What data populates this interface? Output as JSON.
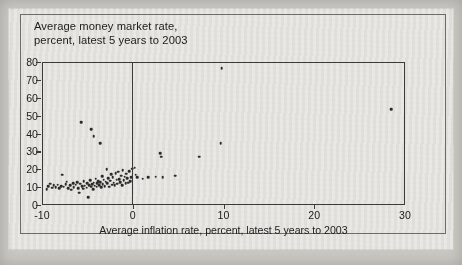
{
  "chart_data": {
    "type": "scatter",
    "title": "Average money market rate, percent, latest 5 years to 2003",
    "title_line1": "Average money market rate,",
    "title_line2": "percent, latest 5 years to 2003",
    "xlabel": "Average inflation rate, percent, latest 5 years to 2003",
    "ylabel": "Average money market rate, percent, latest 5 years to 2003",
    "xlim": [
      -10,
      30
    ],
    "ylim": [
      0,
      80
    ],
    "xticks": [
      -10,
      0,
      10,
      20,
      30
    ],
    "xtick_labels": [
      "-10",
      "0",
      "10",
      "20",
      "30"
    ],
    "yticks": [
      0,
      10,
      20,
      30,
      40,
      50,
      60,
      70,
      80
    ],
    "ytick_labels": [
      "0",
      "10",
      "20",
      "30",
      "40",
      "50",
      "60",
      "70",
      "80"
    ],
    "grid": false,
    "legend": null,
    "reference_lines": [
      {
        "orientation": "vertical",
        "x": 0
      }
    ],
    "marker_color": "#2b2b29",
    "axis_color": "#3a3a38",
    "background_color": "#e9e8e4",
    "points": [
      [
        -9.6,
        9.5
      ],
      [
        -9.4,
        11.0
      ],
      [
        -9.2,
        12.5
      ],
      [
        -9.0,
        10.2
      ],
      [
        -8.8,
        11.8
      ],
      [
        -8.6,
        10.5
      ],
      [
        -8.4,
        12.0
      ],
      [
        -8.2,
        9.8
      ],
      [
        -8.0,
        11.2
      ],
      [
        -7.9,
        17.5
      ],
      [
        -7.7,
        10.8
      ],
      [
        -7.5,
        12.2
      ],
      [
        -7.4,
        13.5
      ],
      [
        -7.2,
        10.0
      ],
      [
        -7.0,
        11.5
      ],
      [
        -6.9,
        9.2
      ],
      [
        -6.7,
        12.8
      ],
      [
        -6.6,
        10.6
      ],
      [
        -6.4,
        11.9
      ],
      [
        -6.2,
        13.2
      ],
      [
        -6.1,
        10.1
      ],
      [
        -6.0,
        7.5
      ],
      [
        -5.9,
        12.4
      ],
      [
        -5.8,
        47.0
      ],
      [
        -5.7,
        11.0
      ],
      [
        -5.6,
        9.6
      ],
      [
        -5.5,
        13.8
      ],
      [
        -5.4,
        11.4
      ],
      [
        -5.2,
        10.3
      ],
      [
        -5.1,
        12.6
      ],
      [
        -5.0,
        5.0
      ],
      [
        -4.9,
        11.7
      ],
      [
        -4.8,
        14.5
      ],
      [
        -4.7,
        43.0
      ],
      [
        -4.7,
        10.9
      ],
      [
        -4.6,
        12.1
      ],
      [
        -4.5,
        9.4
      ],
      [
        -4.4,
        39.0
      ],
      [
        -4.4,
        13.0
      ],
      [
        -4.3,
        11.3
      ],
      [
        -4.2,
        15.2
      ],
      [
        -4.1,
        10.7
      ],
      [
        -4.0,
        12.9
      ],
      [
        -3.9,
        14.0
      ],
      [
        -3.8,
        11.6
      ],
      [
        -3.7,
        35.0
      ],
      [
        -3.7,
        13.4
      ],
      [
        -3.6,
        10.4
      ],
      [
        -3.5,
        16.8
      ],
      [
        -3.4,
        12.3
      ],
      [
        -3.3,
        14.8
      ],
      [
        -3.2,
        11.1
      ],
      [
        -3.1,
        13.7
      ],
      [
        -3.0,
        20.5
      ],
      [
        -2.9,
        12.7
      ],
      [
        -2.8,
        15.6
      ],
      [
        -2.7,
        10.9
      ],
      [
        -2.6,
        14.2
      ],
      [
        -2.5,
        17.8
      ],
      [
        -2.4,
        12.0
      ],
      [
        -2.3,
        16.2
      ],
      [
        -2.2,
        13.1
      ],
      [
        -2.1,
        11.5
      ],
      [
        -2.0,
        18.5
      ],
      [
        -1.9,
        14.6
      ],
      [
        -1.8,
        12.4
      ],
      [
        -1.7,
        19.2
      ],
      [
        -1.6,
        15.0
      ],
      [
        -1.5,
        13.3
      ],
      [
        -1.4,
        17.0
      ],
      [
        -1.3,
        11.8
      ],
      [
        -1.2,
        20.0
      ],
      [
        -1.1,
        14.4
      ],
      [
        -1.0,
        16.5
      ],
      [
        -0.9,
        12.6
      ],
      [
        -0.8,
        18.0
      ],
      [
        -0.7,
        15.4
      ],
      [
        -0.6,
        13.0
      ],
      [
        -0.5,
        19.5
      ],
      [
        -0.4,
        14.0
      ],
      [
        -0.3,
        16.0
      ],
      [
        -0.2,
        20.8
      ],
      [
        0.1,
        21.5
      ],
      [
        0.2,
        17.5
      ],
      [
        0.4,
        16.0
      ],
      [
        1.0,
        15.2
      ],
      [
        1.6,
        16.2
      ],
      [
        2.4,
        16.5
      ],
      [
        2.9,
        29.5
      ],
      [
        3.0,
        27.5
      ],
      [
        3.2,
        16.0
      ],
      [
        4.6,
        17.0
      ],
      [
        7.2,
        27.5
      ],
      [
        9.6,
        35.0
      ],
      [
        9.7,
        77.0
      ],
      [
        28.4,
        54.0
      ]
    ]
  }
}
